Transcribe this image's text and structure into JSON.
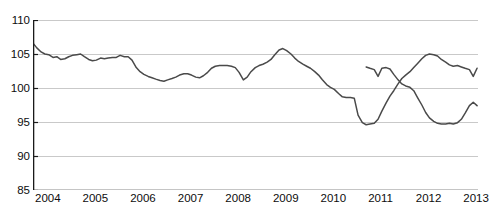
{
  "chart_title_clipped": "REAL RETAIL TRADE INDEX",
  "chart_data": {
    "type": "line",
    "title": "",
    "xlabel": "",
    "ylabel": "",
    "ylim": [
      85,
      110
    ],
    "xlim": [
      2004,
      2013.35
    ],
    "yticks": [
      85,
      90,
      95,
      100,
      105,
      110
    ],
    "ytick_labels": [
      "85",
      "90",
      "95",
      "100",
      "105",
      "110"
    ],
    "xticks": [
      2004,
      2005,
      2006,
      2007,
      2008,
      2009,
      2010,
      2011,
      2012,
      2013
    ],
    "xtick_labels": [
      "2004",
      "2005",
      "2006",
      "2007",
      "2008",
      "2009",
      "2010",
      "2011",
      "2012",
      "2013"
    ],
    "grid": true,
    "grid_axis": "y",
    "legend": false,
    "line_color": "#4a4a4a",
    "grid_color": "#c9c9c9",
    "axis_color": "#1a1a1a",
    "series": [
      {
        "name": "index",
        "x": [
          2004.0,
          2004.08,
          2004.17,
          2004.25,
          2004.33,
          2004.42,
          2004.5,
          2004.58,
          2004.67,
          2004.75,
          2004.83,
          2004.92,
          2005.0,
          2005.08,
          2005.17,
          2005.25,
          2005.33,
          2005.42,
          2005.5,
          2005.58,
          2005.67,
          2005.75,
          2005.83,
          2005.92,
          2006.0,
          2006.08,
          2006.17,
          2006.25,
          2006.33,
          2006.42,
          2006.5,
          2006.58,
          2006.67,
          2006.75,
          2006.83,
          2006.92,
          2007.0,
          2007.08,
          2007.17,
          2007.25,
          2007.33,
          2007.42,
          2007.5,
          2007.58,
          2007.67,
          2007.75,
          2007.83,
          2007.92,
          2008.0,
          2008.08,
          2008.17,
          2008.25,
          2008.33,
          2008.42,
          2008.5,
          2008.58,
          2008.67,
          2008.75,
          2008.83,
          2008.92,
          2009.0,
          2009.08,
          2009.17,
          2009.25,
          2009.33,
          2009.42,
          2009.5,
          2009.58,
          2009.67,
          2009.75,
          2009.83,
          2009.92,
          2010.0,
          2010.08,
          2010.17,
          2010.25,
          2010.33,
          2010.42,
          2010.5,
          2010.58,
          2010.67,
          2010.75,
          2010.83,
          2010.92,
          2011.0,
          2011.08,
          2011.17,
          2011.25,
          2011.33,
          2011.42,
          2011.5,
          2011.58,
          2011.67,
          2011.75,
          2011.83,
          2011.92,
          2012.0,
          2012.08,
          2012.17,
          2012.25,
          2012.33,
          2012.42,
          2012.5,
          2012.58,
          2012.67,
          2012.75,
          2012.83,
          2012.92,
          2013.0,
          2013.08,
          2013.17,
          2013.25,
          2013.33
        ],
        "values": [
          106.6,
          105.9,
          105.3,
          105.0,
          104.9,
          104.5,
          104.6,
          104.2,
          104.3,
          104.6,
          104.8,
          104.9,
          105.0,
          104.6,
          104.2,
          104.0,
          104.1,
          104.4,
          104.3,
          104.4,
          104.5,
          104.5,
          104.8,
          104.6,
          104.6,
          104.1,
          103.0,
          102.4,
          102.0,
          101.7,
          101.5,
          101.3,
          101.1,
          101.0,
          101.2,
          101.4,
          101.6,
          101.9,
          102.1,
          102.1,
          101.9,
          101.6,
          101.5,
          101.8,
          102.3,
          102.9,
          103.2,
          103.3,
          103.3,
          103.3,
          103.2,
          103.0,
          102.3,
          101.2,
          101.6,
          102.4,
          103.0,
          103.3,
          103.5,
          103.8,
          104.2,
          104.9,
          105.6,
          105.8,
          105.5,
          105.0,
          104.4,
          103.9,
          103.5,
          103.2,
          102.9,
          102.4,
          101.9,
          101.2,
          100.5,
          100.1,
          99.8,
          99.2,
          98.7,
          98.6,
          98.6,
          98.5,
          96.0,
          94.9,
          94.6,
          94.7,
          94.8,
          95.4,
          96.6,
          97.8,
          98.8,
          99.6,
          100.6,
          101.4,
          101.9,
          102.4,
          103.0,
          103.6,
          104.3,
          104.8,
          105.0,
          104.9,
          104.7,
          104.2,
          103.8,
          103.4,
          103.2,
          103.3,
          103.1,
          102.9,
          102.7,
          101.7,
          102.9
        ]
      },
      {
        "name": "index_tail",
        "x": [
          2011.0,
          2011.08,
          2011.17,
          2011.25,
          2011.33,
          2011.42,
          2011.5,
          2011.58,
          2011.67,
          2011.75,
          2011.83,
          2011.92,
          2012.0,
          2012.08,
          2012.17,
          2012.25,
          2012.33,
          2012.42,
          2012.5,
          2012.58,
          2012.67,
          2012.75,
          2012.83,
          2012.92,
          2013.0,
          2013.08,
          2013.17,
          2013.25,
          2013.33
        ],
        "values": [
          103.1,
          102.9,
          102.7,
          101.7,
          102.9,
          103.0,
          102.8,
          102.0,
          101.2,
          100.6,
          100.3,
          100.1,
          99.6,
          98.6,
          97.5,
          96.4,
          95.6,
          95.1,
          94.8,
          94.7,
          94.7,
          94.8,
          94.7,
          94.9,
          95.4,
          96.3,
          97.4,
          97.9,
          97.4
        ]
      }
    ]
  }
}
